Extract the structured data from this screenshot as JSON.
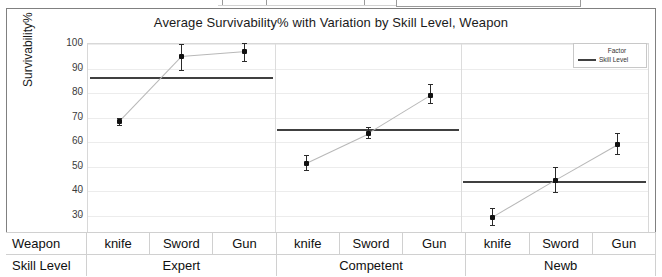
{
  "window": {
    "chrome_box_label": ""
  },
  "chart": {
    "title": "Average Survivability% with Variation by Skill Level, Weapon",
    "ylabel": "Survivability%"
  },
  "legend": {
    "title": "Factor",
    "entries": [
      {
        "label": "Skill Level",
        "color": "#404040"
      }
    ]
  },
  "axis_table": {
    "row_labels": [
      "Weapon",
      "Skill Level"
    ],
    "weapons": [
      "knife",
      "Sword",
      "Gun",
      "knife",
      "Sword",
      "Gun",
      "knife",
      "Sword",
      "Gun"
    ],
    "skill_levels": [
      "Expert",
      "Competent",
      "Newb"
    ]
  },
  "chart_data": {
    "type": "line",
    "title": "Average Survivability% with Variation by Skill Level, Weapon",
    "xlabel": "Weapon / Skill Level",
    "ylabel": "Survivability%",
    "ylim": [
      20,
      100
    ],
    "yticks": [
      20,
      30,
      40,
      50,
      60,
      70,
      80,
      90,
      100
    ],
    "grid": true,
    "legend_position": "top-right",
    "groups": [
      "Expert",
      "Competent",
      "Newb"
    ],
    "categories": [
      "knife",
      "Sword",
      "Gun"
    ],
    "series": [
      {
        "name": "Expert",
        "values": [
          68.5,
          95.0,
          97.0
        ],
        "err_low": [
          67.0,
          89.5,
          93.0
        ],
        "err_high": [
          70.0,
          100.0,
          100.5
        ],
        "group_mean": 86.0
      },
      {
        "name": "Competent",
        "values": [
          51.5,
          63.5,
          79.0
        ],
        "err_low": [
          48.5,
          61.5,
          76.0
        ],
        "err_high": [
          54.5,
          66.0,
          83.5
        ],
        "group_mean": 64.7
      },
      {
        "name": "Newb",
        "values": [
          29.5,
          44.5,
          59.0
        ],
        "err_low": [
          26.0,
          39.5,
          55.0
        ],
        "err_high": [
          33.0,
          50.0,
          63.5
        ],
        "group_mean": 43.5
      }
    ]
  }
}
